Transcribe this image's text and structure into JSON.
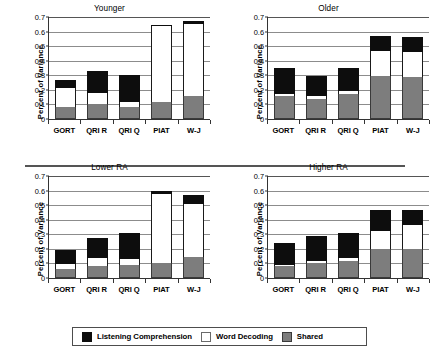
{
  "figure": {
    "ylabel": "Percent of Variance",
    "y_ticks": [
      "0.7",
      "0.6",
      "0.5",
      "0.4",
      "0.3",
      "0.2",
      "0.1",
      "0"
    ],
    "categories": [
      "GORT",
      "QRI R",
      "QRI Q",
      "PIAT",
      "W-J"
    ],
    "legend": [
      {
        "key": "listening",
        "label": "Listening Comprehension",
        "color": "#0d0d0d"
      },
      {
        "key": "decoding",
        "label": "Word Decoding",
        "color": "#ffffff"
      },
      {
        "key": "shared",
        "label": "Shared",
        "color": "#7d7d7d"
      }
    ],
    "panels": [
      {
        "title": "Younger"
      },
      {
        "title": "Older"
      },
      {
        "title": "Lower RA"
      },
      {
        "title": "Higher RA"
      }
    ]
  },
  "chart_data": [
    {
      "type": "bar",
      "stacked": true,
      "title": "Younger",
      "xlabel": "",
      "ylabel": "Percent of Variance",
      "ylim": [
        0,
        0.7
      ],
      "ytick_step": 0.1,
      "grid": true,
      "legend_position": "bottom",
      "categories": [
        "GORT",
        "QRI R",
        "QRI Q",
        "PIAT",
        "W-J"
      ],
      "series": [
        {
          "name": "Shared",
          "color": "#7d7d7d",
          "values": [
            0.085,
            0.1,
            0.08,
            0.115,
            0.16
          ]
        },
        {
          "name": "Word Decoding",
          "color": "#ffffff",
          "values": [
            0.125,
            0.08,
            0.04,
            0.52,
            0.495
          ]
        },
        {
          "name": "Listening Comprehension",
          "color": "#0d0d0d",
          "values": [
            0.06,
            0.15,
            0.185,
            0.01,
            0.02
          ]
        }
      ],
      "totals": [
        0.27,
        0.33,
        0.305,
        0.645,
        0.675
      ]
    },
    {
      "type": "bar",
      "stacked": true,
      "title": "Older",
      "xlabel": "",
      "ylabel": "Percent of Variance",
      "ylim": [
        0,
        0.7
      ],
      "ytick_step": 0.1,
      "grid": true,
      "legend_position": "bottom",
      "categories": [
        "GORT",
        "QRI R",
        "QRI Q",
        "PIAT",
        "W-J"
      ],
      "series": [
        {
          "name": "Shared",
          "color": "#7d7d7d",
          "values": [
            0.16,
            0.14,
            0.175,
            0.295,
            0.29
          ]
        },
        {
          "name": "Word Decoding",
          "color": "#ffffff",
          "values": [
            0.015,
            0.015,
            0.02,
            0.17,
            0.17
          ]
        },
        {
          "name": "Listening Comprehension",
          "color": "#0d0d0d",
          "values": [
            0.175,
            0.14,
            0.155,
            0.105,
            0.1
          ]
        }
      ],
      "totals": [
        0.35,
        0.295,
        0.35,
        0.57,
        0.56
      ]
    },
    {
      "type": "bar",
      "stacked": true,
      "title": "Lower RA",
      "xlabel": "",
      "ylabel": "Percent of Variance",
      "ylim": [
        0,
        0.7
      ],
      "ytick_step": 0.1,
      "grid": true,
      "legend_position": "bottom",
      "categories": [
        "GORT",
        "QRI R",
        "QRI Q",
        "PIAT",
        "W-J"
      ],
      "series": [
        {
          "name": "Shared",
          "color": "#7d7d7d",
          "values": [
            0.06,
            0.085,
            0.09,
            0.1,
            0.145
          ]
        },
        {
          "name": "Word Decoding",
          "color": "#ffffff",
          "values": [
            0.035,
            0.055,
            0.04,
            0.48,
            0.36
          ]
        },
        {
          "name": "Listening Comprehension",
          "color": "#0d0d0d",
          "values": [
            0.095,
            0.135,
            0.18,
            0.015,
            0.065
          ]
        }
      ],
      "totals": [
        0.19,
        0.275,
        0.31,
        0.595,
        0.57
      ]
    },
    {
      "type": "bar",
      "stacked": true,
      "title": "Higher RA",
      "xlabel": "",
      "ylabel": "Percent of Variance",
      "ylim": [
        0,
        0.7
      ],
      "ytick_step": 0.1,
      "grid": true,
      "legend_position": "bottom",
      "categories": [
        "GORT",
        "QRI R",
        "QRI Q",
        "PIAT",
        "W-J"
      ],
      "series": [
        {
          "name": "Shared",
          "color": "#7d7d7d",
          "values": [
            0.08,
            0.105,
            0.115,
            0.2,
            0.2
          ]
        },
        {
          "name": "Word Decoding",
          "color": "#ffffff",
          "values": [
            0.01,
            0.01,
            0.02,
            0.12,
            0.165
          ]
        },
        {
          "name": "Listening Comprehension",
          "color": "#0d0d0d",
          "values": [
            0.15,
            0.17,
            0.175,
            0.15,
            0.1
          ]
        }
      ],
      "totals": [
        0.24,
        0.285,
        0.31,
        0.47,
        0.465
      ]
    }
  ]
}
